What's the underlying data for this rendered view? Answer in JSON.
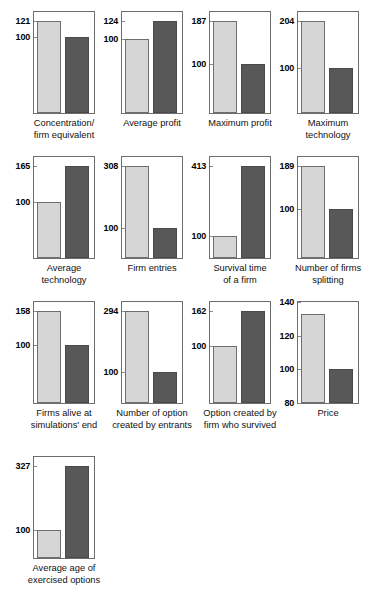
{
  "figure": {
    "columns": 4,
    "reference_value": 100,
    "series": [
      {
        "name": "Reference (baseline)",
        "color": "#d6d6d6"
      },
      {
        "name": "Comparison",
        "color": "#585858"
      }
    ]
  },
  "chart_data": [
    {
      "type": "bar",
      "title": "Concentration/ firm equivalent",
      "title_lines": [
        "Concentration/",
        "firm equivalent"
      ],
      "categories": [
        "Reference",
        "Comparison"
      ],
      "values": [
        121,
        100
      ],
      "tick_labels": [
        "121",
        "100"
      ],
      "ylim": [
        0,
        133
      ],
      "ylabel": "",
      "xlabel": "",
      "grid": false
    },
    {
      "type": "bar",
      "title": "Average profit",
      "title_lines": [
        "Average profit",
        ""
      ],
      "categories": [
        "Reference",
        "Comparison"
      ],
      "values": [
        100,
        124
      ],
      "tick_labels": [
        "124",
        "100"
      ],
      "ylim": [
        0,
        136
      ],
      "ylabel": "",
      "xlabel": "",
      "grid": false
    },
    {
      "type": "bar",
      "title": "Maximum profit",
      "title_lines": [
        "Maximum profit",
        ""
      ],
      "categories": [
        "Reference",
        "Comparison"
      ],
      "values": [
        187,
        100
      ],
      "tick_labels": [
        "187",
        "100"
      ],
      "ylim": [
        0,
        205
      ],
      "ylabel": "",
      "xlabel": "",
      "grid": false
    },
    {
      "type": "bar",
      "title": "Maximum technology",
      "title_lines": [
        "Maximum",
        "technology"
      ],
      "categories": [
        "Reference",
        "Comparison"
      ],
      "values": [
        204,
        100
      ],
      "tick_labels": [
        "204",
        "100"
      ],
      "ylim": [
        0,
        224
      ],
      "ylabel": "",
      "xlabel": "",
      "grid": false
    },
    {
      "type": "bar",
      "title": "Average technology",
      "title_lines": [
        "Average",
        "technology"
      ],
      "categories": [
        "Reference",
        "Comparison"
      ],
      "values": [
        100,
        165
      ],
      "tick_labels": [
        "165",
        "100"
      ],
      "ylim": [
        0,
        181
      ],
      "ylabel": "",
      "xlabel": "",
      "grid": false
    },
    {
      "type": "bar",
      "title": "Firm entries",
      "title_lines": [
        "Firm entries",
        ""
      ],
      "categories": [
        "Reference",
        "Comparison"
      ],
      "values": [
        308,
        100
      ],
      "tick_labels": [
        "308",
        "100"
      ],
      "ylim": [
        0,
        338
      ],
      "ylabel": "",
      "xlabel": "",
      "grid": false
    },
    {
      "type": "bar",
      "title": "Survival time of a firm",
      "title_lines": [
        "Survival time",
        "of a firm"
      ],
      "categories": [
        "Reference",
        "Comparison"
      ],
      "values": [
        100,
        413
      ],
      "tick_labels": [
        "413",
        "100"
      ],
      "ylim": [
        0,
        453
      ],
      "ylabel": "",
      "xlabel": "",
      "grid": false
    },
    {
      "type": "bar",
      "title": "Number of firms splitting",
      "title_lines": [
        "Number of firms",
        "splitting"
      ],
      "categories": [
        "Reference",
        "Comparison"
      ],
      "values": [
        189,
        100
      ],
      "tick_labels": [
        "189",
        "100"
      ],
      "ylim": [
        0,
        207
      ],
      "ylabel": "",
      "xlabel": "",
      "grid": false
    },
    {
      "type": "bar",
      "title": "Firms alive at simulations' end",
      "title_lines": [
        "Firms alive at",
        "simulations' end"
      ],
      "categories": [
        "Reference",
        "Comparison"
      ],
      "values": [
        158,
        100
      ],
      "tick_labels": [
        "158",
        "100"
      ],
      "ylim": [
        0,
        173
      ],
      "ylabel": "",
      "xlabel": "",
      "grid": false
    },
    {
      "type": "bar",
      "title": "Number of option created by entrants",
      "title_lines": [
        "Number of option",
        "created by entrants"
      ],
      "categories": [
        "Reference",
        "Comparison"
      ],
      "values": [
        294,
        100
      ],
      "tick_labels": [
        "294",
        "100"
      ],
      "ylim": [
        0,
        322
      ],
      "ylabel": "",
      "xlabel": "",
      "grid": false
    },
    {
      "type": "bar",
      "title": "Option created by firm who survived",
      "title_lines": [
        "Option created by",
        "firm who survived"
      ],
      "categories": [
        "Reference",
        "Comparison"
      ],
      "values": [
        100,
        162
      ],
      "tick_labels": [
        "162",
        "100"
      ],
      "ylim": [
        0,
        178
      ],
      "ylabel": "",
      "xlabel": "",
      "grid": false
    },
    {
      "type": "bar",
      "title": "Price",
      "title_lines": [
        "Price",
        ""
      ],
      "categories": [
        "Reference",
        "Comparison"
      ],
      "values": [
        133,
        100
      ],
      "tick_labels": [
        "140",
        "120",
        "100",
        "80"
      ],
      "ylim": [
        80,
        140
      ],
      "ylabel": "",
      "xlabel": "",
      "grid": false
    },
    {
      "type": "bar",
      "title": "Average age of exercised options",
      "title_lines": [
        "Average age of",
        "exercised options"
      ],
      "categories": [
        "Reference",
        "Comparison"
      ],
      "values": [
        100,
        327
      ],
      "tick_labels": [
        "327",
        "100"
      ],
      "ylim": [
        0,
        359
      ],
      "ylabel": "",
      "xlabel": "",
      "grid": false
    }
  ]
}
